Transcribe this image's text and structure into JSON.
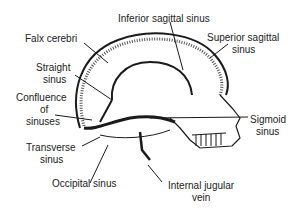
{
  "diagram": {
    "labels": {
      "inferior_sagittal_sinus": "Inferior sagittal sinus",
      "falx_cerebri": "Falx cerebri",
      "superior_sagittal_sinus_1": "Superior sagittal",
      "superior_sagittal_sinus_2": "sinus",
      "straight_sinus_1": "Straight",
      "straight_sinus_2": "sinus",
      "confluence_1": "Confluence",
      "confluence_2": "of",
      "confluence_3": "sinuses",
      "sigmoid_sinus_1": "Sigmoid",
      "sigmoid_sinus_2": "sinus",
      "transverse_sinus_1": "Transverse",
      "transverse_sinus_2": "sinus",
      "occipital_sinus": "Occipital sinus",
      "internal_jugular_vein_1": "Internal jugular",
      "internal_jugular_vein_2": "vein"
    },
    "colors": {
      "line": "#1a1a1a",
      "text": "#222222",
      "background": "#ffffff",
      "shade": "#555555"
    }
  }
}
